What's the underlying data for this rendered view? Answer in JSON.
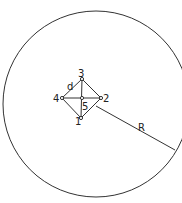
{
  "diagram": {
    "circle": {
      "cx": 96,
      "cy": 104,
      "r": 93
    },
    "nodes": [
      {
        "id": "1",
        "label": "1",
        "x": 81,
        "y": 118
      },
      {
        "id": "2",
        "label": "2",
        "x": 101,
        "y": 98
      },
      {
        "id": "3",
        "label": "3",
        "x": 82,
        "y": 79
      },
      {
        "id": "4",
        "label": "4",
        "x": 62,
        "y": 98
      },
      {
        "id": "5",
        "label": "5",
        "x": 82,
        "y": 98
      }
    ],
    "labels": {
      "spacing": "d",
      "radius": "R"
    },
    "colors": {
      "stroke": "#222222",
      "background": "#ffffff"
    }
  }
}
